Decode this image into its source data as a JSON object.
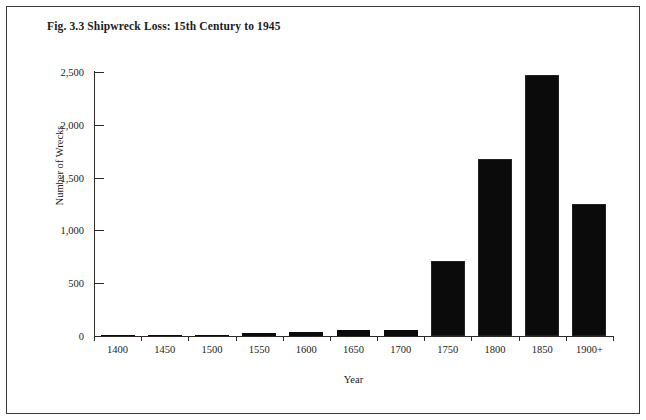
{
  "figure": {
    "title": "Fig. 3.3 Shipwreck Loss: 15th Century to 1945"
  },
  "chart_data": {
    "type": "bar",
    "title": "Fig. 3.3 Shipwreck Loss: 15th Century to 1945",
    "xlabel": "Year",
    "ylabel": "Number of Wrecks",
    "categories": [
      "1400",
      "1450",
      "1500",
      "1550",
      "1600",
      "1650",
      "1700",
      "1750",
      "1800",
      "1850",
      "1900+"
    ],
    "values": [
      2,
      10,
      5,
      25,
      38,
      55,
      60,
      710,
      1680,
      2470,
      1250
    ],
    "ylim": [
      0,
      2500
    ],
    "ytick_labels": [
      "0",
      "500",
      "1,000",
      "1,500",
      "2,000",
      "2,500"
    ],
    "ytick_values": [
      0,
      500,
      1000,
      1500,
      2000,
      2500
    ],
    "grid": false,
    "legend": "none",
    "bar_color": "#0b0b0b",
    "axis_color": "#2e2a27",
    "background": "#ffffff"
  }
}
